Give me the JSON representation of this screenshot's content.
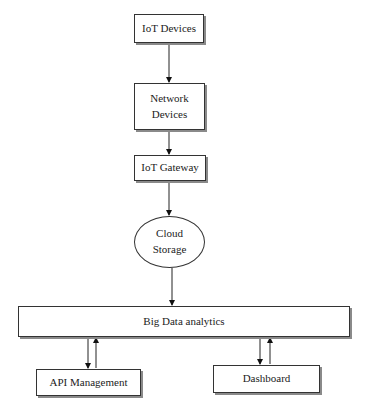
{
  "diagram": {
    "type": "flowchart",
    "nodes": {
      "iot_devices": {
        "label": "IoT Devices",
        "shape": "rectangle"
      },
      "network_devices": {
        "label": "Network\nDevices",
        "line1": "Network",
        "line2": "Devices",
        "shape": "rectangle"
      },
      "iot_gateway": {
        "label": "IoT Gateway",
        "shape": "rectangle"
      },
      "cloud_storage": {
        "label": "Cloud\nStorage",
        "line1": "Cloud",
        "line2": "Storage",
        "shape": "ellipse"
      },
      "big_data": {
        "label": "Big Data analytics",
        "shape": "rectangle"
      },
      "api_management": {
        "label": "API Management",
        "shape": "rectangle"
      },
      "dashboard": {
        "label": "Dashboard",
        "shape": "rectangle"
      }
    },
    "edges": [
      {
        "from": "IoT Devices",
        "to": "Network Devices"
      },
      {
        "from": "Network Devices",
        "to": "IoT Gateway"
      },
      {
        "from": "IoT Gateway",
        "to": "Cloud Storage"
      },
      {
        "from": "Cloud Storage",
        "to": "Big Data analytics"
      },
      {
        "from": "Big Data analytics",
        "to": "API Management"
      },
      {
        "from": "API Management",
        "to": "Big Data analytics"
      },
      {
        "from": "Big Data analytics",
        "to": "Dashboard"
      },
      {
        "from": "Dashboard",
        "to": "Big Data analytics"
      }
    ]
  }
}
